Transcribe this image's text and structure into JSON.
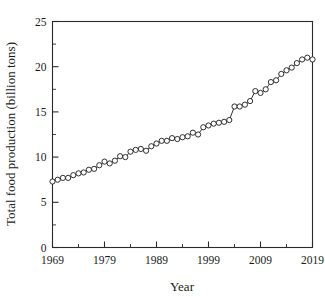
{
  "chart_data": {
    "type": "line",
    "title": "",
    "subtitle": "",
    "xlabel": "Year",
    "ylabel": "Total food production (billion tons)",
    "xlim": [
      1969,
      2019
    ],
    "ylim": [
      0,
      25
    ],
    "xticks": [
      1969,
      1979,
      1989,
      1999,
      2009,
      2019
    ],
    "xtick_labels": [
      "1969",
      "1979",
      "1989",
      "1999",
      "2009",
      "2019"
    ],
    "xminor_ticks": [
      1974,
      1984,
      1994,
      2004,
      2014
    ],
    "yticks": [
      0,
      5,
      10,
      15,
      20,
      25
    ],
    "ytick_labels": [
      "0",
      "5",
      "10",
      "15",
      "20",
      "25"
    ],
    "yminor_ticks": [
      2.5,
      7.5,
      12.5,
      17.5,
      22.5
    ],
    "grid": false,
    "legend": null,
    "legend_position": "none",
    "marker": "open-circle",
    "line_color": "#1a1a1a",
    "marker_face_color": "#ffffff",
    "x": [
      1969,
      1970,
      1971,
      1972,
      1973,
      1974,
      1975,
      1976,
      1977,
      1978,
      1979,
      1980,
      1981,
      1982,
      1983,
      1984,
      1985,
      1986,
      1987,
      1988,
      1989,
      1990,
      1991,
      1992,
      1993,
      1994,
      1995,
      1996,
      1997,
      1998,
      1999,
      2000,
      2001,
      2002,
      2003,
      2004,
      2005,
      2006,
      2007,
      2008,
      2009,
      2010,
      2011,
      2012,
      2013,
      2014,
      2015,
      2016,
      2017,
      2018,
      2019
    ],
    "values": [
      7.3,
      7.5,
      7.7,
      7.7,
      8.0,
      8.2,
      8.3,
      8.6,
      8.7,
      9.1,
      9.5,
      9.3,
      9.6,
      10.1,
      10.0,
      10.6,
      10.8,
      10.9,
      10.7,
      11.2,
      11.5,
      11.8,
      11.8,
      12.1,
      12.0,
      12.2,
      12.3,
      12.7,
      12.5,
      13.3,
      13.5,
      13.7,
      13.8,
      13.9,
      14.1,
      15.6,
      15.6,
      15.8,
      16.2,
      17.3,
      17.1,
      17.5,
      18.3,
      18.5,
      19.2,
      19.6,
      19.9,
      20.4,
      20.8,
      21.0,
      20.8
    ],
    "series": [
      {
        "name": "Total food production",
        "values": [
          7.3,
          7.5,
          7.7,
          7.7,
          8.0,
          8.2,
          8.3,
          8.6,
          8.7,
          9.1,
          9.5,
          9.3,
          9.6,
          10.1,
          10.0,
          10.6,
          10.8,
          10.9,
          10.7,
          11.2,
          11.5,
          11.8,
          11.8,
          12.1,
          12.0,
          12.2,
          12.3,
          12.7,
          12.5,
          13.3,
          13.5,
          13.7,
          13.8,
          13.9,
          14.1,
          15.6,
          15.6,
          15.8,
          16.2,
          17.3,
          17.1,
          17.5,
          18.3,
          18.5,
          19.2,
          19.6,
          19.9,
          20.4,
          20.8,
          21.0,
          20.8
        ]
      }
    ]
  }
}
